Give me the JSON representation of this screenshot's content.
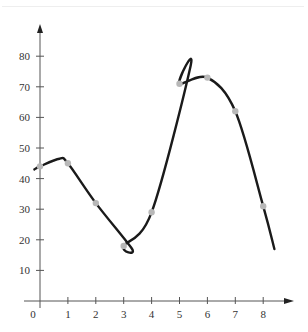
{
  "chart_data": {
    "type": "line",
    "title": "",
    "xlabel": "",
    "ylabel": "",
    "x": [
      0,
      1,
      2,
      3,
      4,
      5,
      6,
      7,
      8
    ],
    "series": [
      {
        "name": "data points",
        "values": [
          44,
          45,
          32,
          18,
          29,
          71,
          73,
          62,
          31
        ]
      }
    ],
    "curve": {
      "description": "smooth interpolating curve through the points",
      "start": [
        -0.2,
        43
      ],
      "local_max_1": [
        0.7,
        46.5
      ],
      "local_min": [
        3.3,
        17
      ],
      "local_max_2": [
        5.4,
        77
      ],
      "end": [
        8.4,
        17
      ]
    },
    "x_ticks": [
      "0",
      "1",
      "2",
      "3",
      "4",
      "5",
      "6",
      "7",
      "8"
    ],
    "y_ticks": [
      "10",
      "20",
      "30",
      "40",
      "50",
      "60",
      "70",
      "80"
    ],
    "xlim": [
      0,
      9
    ],
    "ylim": [
      0,
      85
    ],
    "grid": false,
    "legend": null,
    "colors": {
      "curve": "#1a1a1a",
      "points": "#b8b8b8",
      "axes": "#555555"
    }
  }
}
